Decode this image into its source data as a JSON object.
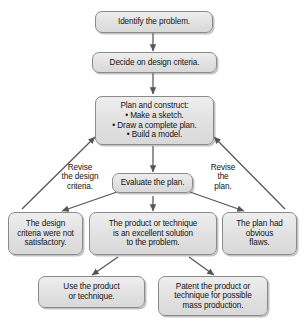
{
  "diagram": {
    "accent_fill": "#e3e3e3",
    "border_color": "#8a8a8a",
    "text_color": "#141414",
    "arrow_color": "#555555",
    "nodes": {
      "identify": "Identify the problem.",
      "decide": "Decide on design criteria.",
      "plan": "Plan and construct:\n• Make a sketch.\n• Draw a complete plan.\n• Build a model.",
      "evaluate": "Evaluate the plan.",
      "outcome_left": "The design\ncriteria were not\nsatisfactory.",
      "outcome_center": "The product or technique\nis an excellent solution\nto the  problem.",
      "outcome_right": "The plan had\nobvious\nflaws.",
      "action_left": "Use the product\nor technique.",
      "action_right": "Patent the product or\ntechnique for possible\nmass production."
    },
    "edge_labels": {
      "revise_criteria": "Revise\nthe design\ncriteria.",
      "revise_plan": "Revise\nthe\nplan."
    }
  }
}
